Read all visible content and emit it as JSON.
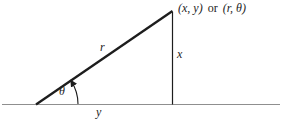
{
  "diagram": {
    "labels": {
      "point_xy": "(x, y)",
      "or_word": "or",
      "point_rtheta": "(r, θ)",
      "hypotenuse": "r",
      "angle": "θ",
      "vertical_side": "x",
      "horizontal_side": "y"
    },
    "colors": {
      "line": "#1d1d1d",
      "baseline": "#8f8f8f",
      "background": "#ffffff",
      "text": "#1d1d1d"
    }
  }
}
